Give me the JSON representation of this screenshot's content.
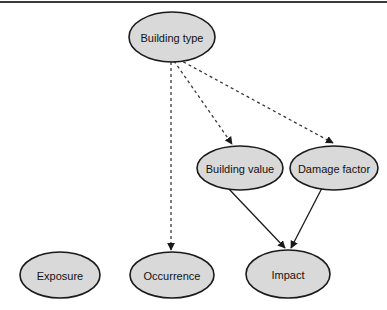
{
  "diagram": {
    "background_color": "#ffffff",
    "node_fill_color": "#d9d9d9",
    "node_stroke_color": "#1a1a1a",
    "edge_color": "#1a1a1a",
    "top_rule_color": "#3a3a3a",
    "nodes": [
      {
        "id": "building_type",
        "label": "Building type",
        "cx": 172,
        "cy": 37,
        "rx": 43,
        "ry": 25
      },
      {
        "id": "building_value",
        "label": "Building value",
        "cx": 240,
        "cy": 168,
        "rx": 43,
        "ry": 22
      },
      {
        "id": "damage_factor",
        "label": "Damage factor",
        "cx": 334,
        "cy": 168,
        "rx": 44,
        "ry": 22
      },
      {
        "id": "exposure",
        "label": "Exposure",
        "cx": 60,
        "cy": 275,
        "rx": 40,
        "ry": 23
      },
      {
        "id": "occurrence",
        "label": "Occurrence",
        "cx": 172,
        "cy": 275,
        "rx": 42,
        "ry": 23
      },
      {
        "id": "impact",
        "label": "Impact",
        "cx": 288,
        "cy": 274,
        "rx": 42,
        "ry": 24
      }
    ],
    "edges": [
      {
        "id": "building_type-to-building_value",
        "from": "building_type",
        "to": "building_value",
        "style": "dashed",
        "x1": 174,
        "y1": 61,
        "x2": 232,
        "y2": 144
      },
      {
        "id": "building_type-to-damage_factor",
        "from": "building_type",
        "to": "damage_factor",
        "style": "dashed",
        "x1": 178,
        "y1": 59,
        "x2": 333,
        "y2": 143
      },
      {
        "id": "building_type-to-occurrence",
        "from": "building_type",
        "to": "occurrence",
        "style": "dashed",
        "x1": 171,
        "y1": 62,
        "x2": 171,
        "y2": 250
      },
      {
        "id": "building_value-to-impact",
        "from": "building_value",
        "to": "impact",
        "style": "solid",
        "x1": 228,
        "y1": 188,
        "x2": 285,
        "y2": 248
      },
      {
        "id": "damage_factor-to-impact",
        "from": "damage_factor",
        "to": "impact",
        "style": "solid",
        "x1": 322,
        "y1": 188,
        "x2": 291,
        "y2": 248
      }
    ]
  }
}
